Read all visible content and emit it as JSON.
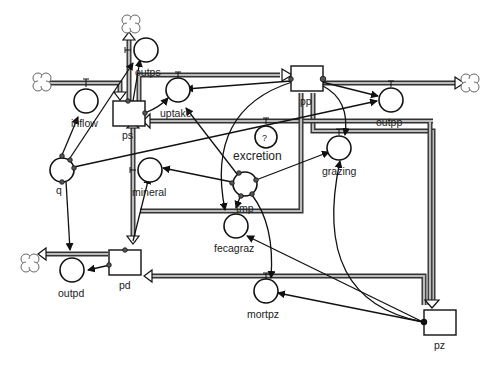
{
  "diagram": {
    "type": "stock-and-flow",
    "stocks": [
      {
        "id": "ps",
        "label": "ps"
      },
      {
        "id": "pp",
        "label": "pp"
      },
      {
        "id": "pd",
        "label": "pd"
      },
      {
        "id": "pz",
        "label": "pz"
      }
    ],
    "flows": [
      {
        "id": "inflow",
        "label": "inflow"
      },
      {
        "id": "outps",
        "label": "outps"
      },
      {
        "id": "uptake",
        "label": "uptake"
      },
      {
        "id": "outpp",
        "label": "outpp"
      },
      {
        "id": "excretion",
        "label": "excretion",
        "marker": "?"
      },
      {
        "id": "grazing",
        "label": "grazing"
      },
      {
        "id": "mineral",
        "label": "mineral"
      },
      {
        "id": "fecagraz",
        "label": "fecagraz"
      },
      {
        "id": "mortpz",
        "label": "mortpz"
      },
      {
        "id": "outpd",
        "label": "outpd"
      }
    ],
    "converters": [
      {
        "id": "q",
        "label": "q"
      },
      {
        "id": "tmp",
        "label": "tmp"
      }
    ],
    "icons": {
      "cloud": "cloud-source-sink-icon",
      "stock": "stock-box-icon",
      "flow": "flow-valve-icon",
      "converter": "converter-circle-icon"
    },
    "colors": {
      "line": "#111111",
      "pipe_fill": "#bbbbbb",
      "background": "#ffffff"
    }
  }
}
